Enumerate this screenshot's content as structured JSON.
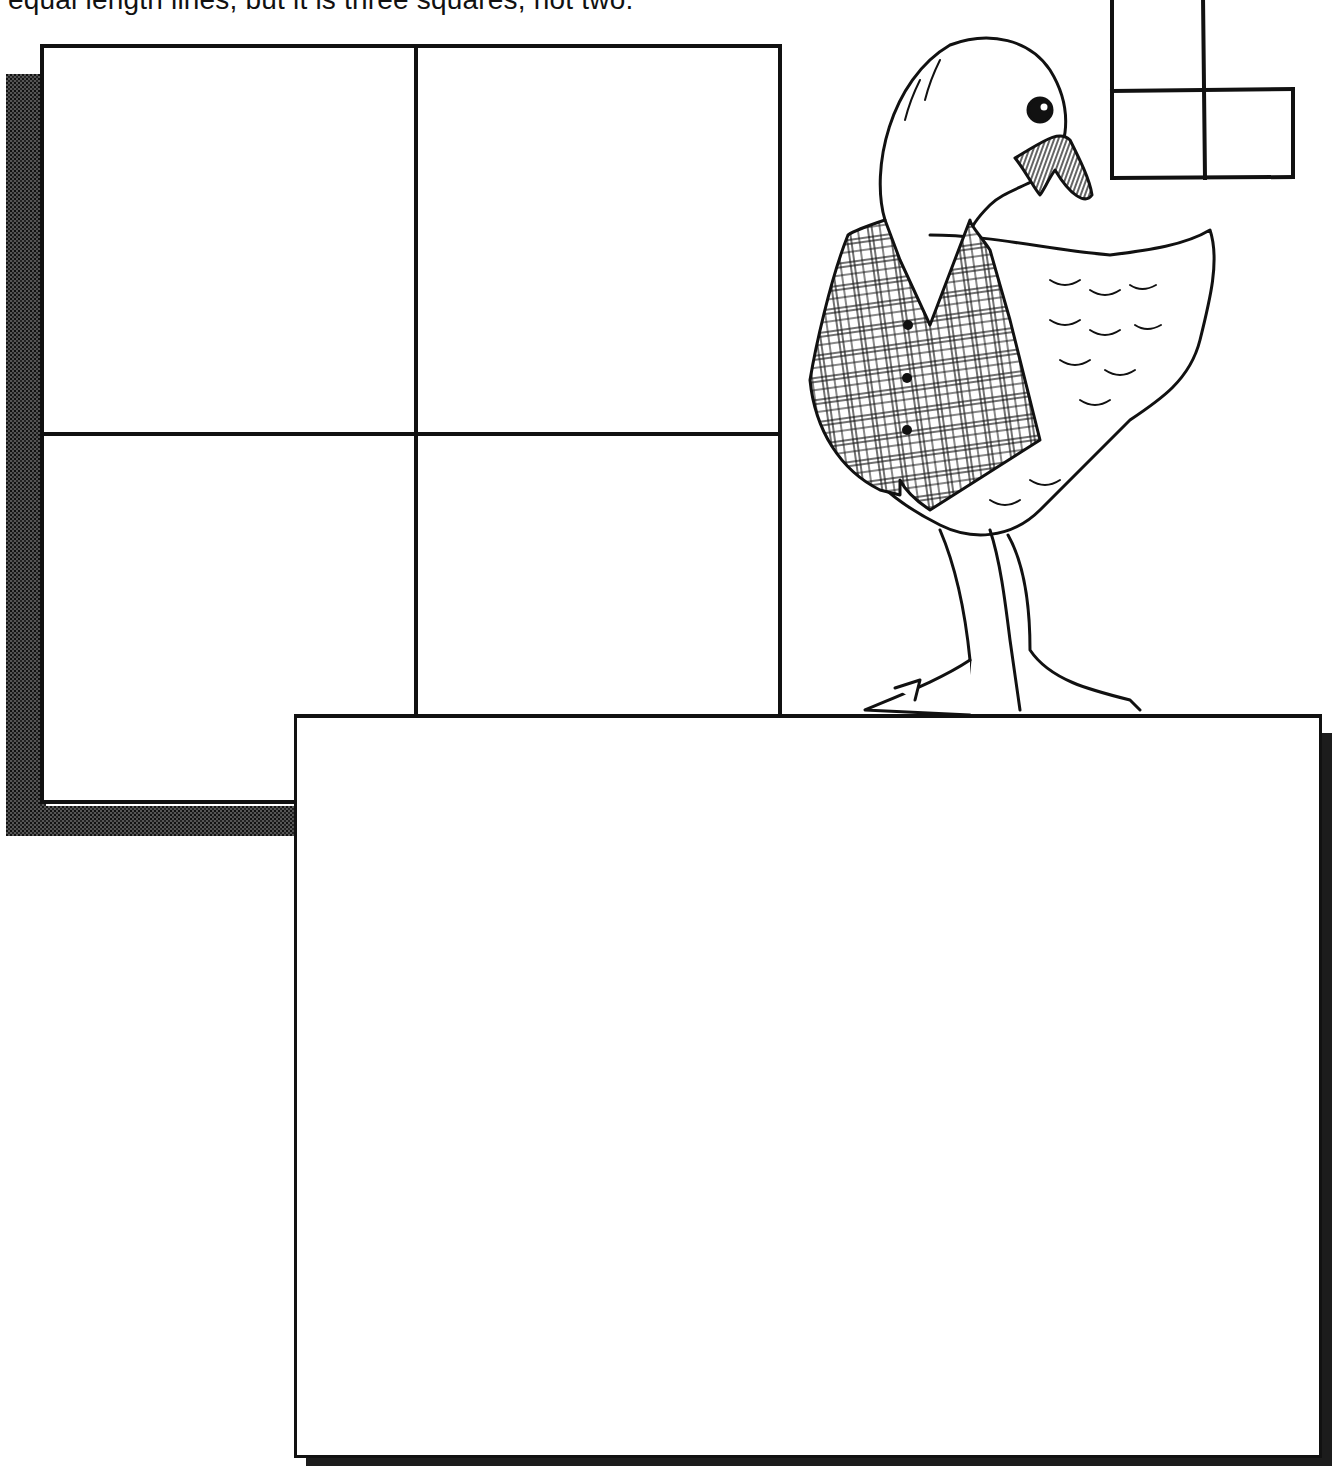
{
  "page": {
    "caption": "equal length lines, but it is three squares, not two."
  },
  "puzzle": {
    "main_grid": {
      "rows": 2,
      "cols": 2,
      "description": "four-square grid made of matchstick lines"
    },
    "example_figure": {
      "description": "L-shaped arrangement of three squares",
      "squares": 3
    },
    "answer_area": {
      "description": "blank drawing box"
    }
  },
  "illustration": {
    "subject": "goose wearing a plaid vest",
    "colors": {
      "ink": "#111111",
      "paper": "#ffffff",
      "shadow": "#1c1c1c"
    }
  }
}
